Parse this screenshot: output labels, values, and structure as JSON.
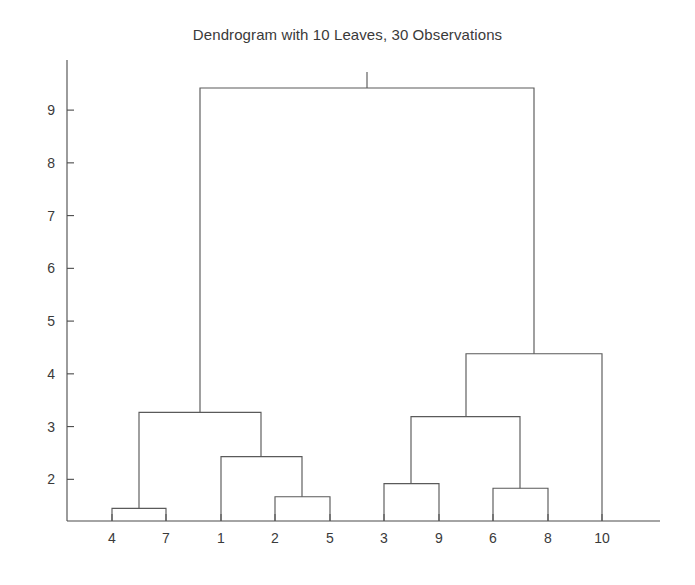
{
  "chart_data": {
    "type": "dendrogram",
    "title": "Dendrogram with 10 Leaves, 30 Observations",
    "xlabel": "",
    "ylabel": "",
    "grid": false,
    "legend": "none",
    "leaf_count": 10,
    "observation_count": 30,
    "leaf_labels": [
      "4",
      "7",
      "1",
      "2",
      "5",
      "3",
      "9",
      "6",
      "8",
      "10"
    ],
    "leaf_positions": [
      112,
      166,
      221,
      275,
      330,
      384,
      439,
      493,
      548,
      602
    ],
    "ylim": [
      1.21,
      9.95
    ],
    "yticks": [
      2,
      3,
      4,
      5,
      6,
      7,
      8,
      9
    ],
    "ytick_labels": [
      "2",
      "3",
      "4",
      "5",
      "6",
      "7",
      "8",
      "9"
    ],
    "merges": [
      {
        "id": "m1",
        "label": "4-7",
        "left": "4",
        "right": "7",
        "height": 1.45,
        "x_left": 112,
        "x_right": 166,
        "x_center": 139
      },
      {
        "id": "m2",
        "label": "2-5",
        "left": "2",
        "right": "5",
        "height": 1.67,
        "x_left": 275,
        "x_right": 330,
        "x_center": 302
      },
      {
        "id": "m3",
        "label": "6-8",
        "left": "6",
        "right": "8",
        "height": 1.83,
        "x_left": 493,
        "x_right": 548,
        "x_center": 520
      },
      {
        "id": "m4",
        "label": "3-9",
        "left": "3",
        "right": "9",
        "height": 1.92,
        "x_left": 384,
        "x_right": 439,
        "x_center": 411
      },
      {
        "id": "m5",
        "label": "1-(2,5)",
        "left": "1",
        "right": "m2",
        "height": 2.43,
        "x_left": 221,
        "x_right": 302,
        "x_center": 261
      },
      {
        "id": "m6",
        "label": "(3,9)-(6,8)",
        "left": "m4",
        "right": "m3",
        "height": 3.19,
        "x_left": 411,
        "x_right": 520,
        "x_center": 466
      },
      {
        "id": "m7",
        "label": "(4,7)-(1,2,5)",
        "left": "m1",
        "right": "m5",
        "height": 3.27,
        "x_left": 139,
        "x_right": 261,
        "x_center": 200
      },
      {
        "id": "m8",
        "label": "((3,9),(6,8))-10",
        "left": "m6",
        "right": "10",
        "height": 4.38,
        "x_left": 466,
        "x_right": 602,
        "x_center": 534
      },
      {
        "id": "m9",
        "label": "root",
        "left": "m7",
        "right": "m8",
        "height": 9.42,
        "x_left": 200,
        "x_right": 534,
        "x_center": 367
      }
    ],
    "colors": {
      "link": "#5a5a5a",
      "axis": "#4a4a4a",
      "text": "#3a3a3a",
      "background": "#ffffff"
    }
  },
  "axes": {
    "plot_left": 67,
    "plot_right": 660,
    "plot_bottom": 521,
    "plot_top": 60
  }
}
